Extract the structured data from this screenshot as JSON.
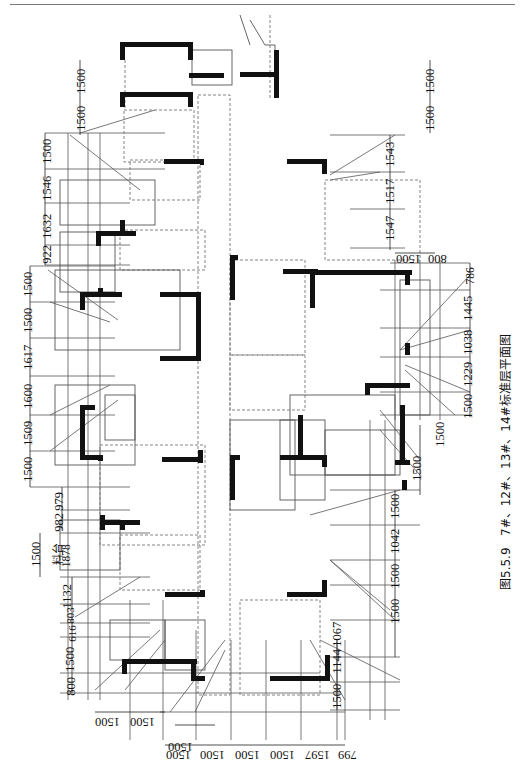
{
  "caption": {
    "figure_no": "图5.5.9",
    "title": "7#、12#、13#、14#标准层平面图"
  },
  "label_cailiao": "料台",
  "dims": {
    "left_outer": [
      "1500",
      "1500",
      "1500",
      "1546",
      "1632",
      "922",
      "1500",
      "1500",
      "1617",
      "1600",
      "1509",
      "1500",
      "979",
      "982",
      "1878",
      "1132",
      "803",
      "616",
      "1500",
      "800"
    ],
    "left_extra": "1500",
    "right_top": [
      "1500",
      "1500"
    ],
    "right_upper": [
      "1543",
      "1517",
      "1547"
    ],
    "right_step": [
      "800",
      "1500"
    ],
    "right_mid": [
      "786",
      "1445",
      "1038",
      "1229",
      "1500"
    ],
    "right_lower_a": [
      "1500",
      "1500"
    ],
    "right_lower_b": [
      "1500",
      "1042",
      "1500",
      "1500"
    ],
    "right_bottom": [
      "1067",
      "1144",
      "1500"
    ],
    "bottom_left": [
      "1500",
      "1500"
    ],
    "bottom_main": [
      "1500",
      "1500",
      "1500",
      "1500",
      "1597",
      "799"
    ],
    "bottom_single": "1500"
  },
  "colors": {
    "wall": "#111111",
    "line": "#555555",
    "dash": "#777777",
    "text": "#111111"
  }
}
